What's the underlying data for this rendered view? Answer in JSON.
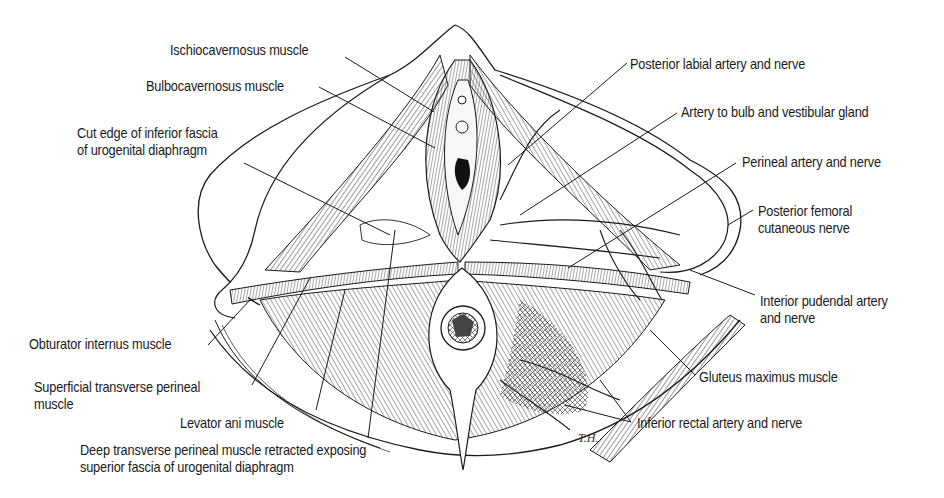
{
  "figure": {
    "signature": "T.H.",
    "colors": {
      "ink": "#1a1a1a",
      "background": "#ffffff",
      "shade": "#3a3a3a"
    }
  },
  "labels": {
    "left": [
      {
        "id": "ischiocavernosus",
        "text": "Ischiocavernosus muscle"
      },
      {
        "id": "bulbocavernosus",
        "text": "Bulbocavernosus muscle"
      },
      {
        "id": "cut_edge",
        "line1": "Cut edge of inferior fascia",
        "line2": "of urogenital diaphragm"
      },
      {
        "id": "obturator",
        "text": "Obturator internus muscle"
      },
      {
        "id": "superficial_transverse",
        "line1": "Superficial transverse perineal",
        "line2": "muscle"
      },
      {
        "id": "levator_ani",
        "text": "Levator ani muscle"
      },
      {
        "id": "deep_transverse",
        "line1": "Deep transverse perineal muscle retracted exposing",
        "line2": "superior fascia of urogenital diaphragm"
      }
    ],
    "right": [
      {
        "id": "posterior_labial",
        "text": "Posterior labial artery and nerve"
      },
      {
        "id": "artery_bulb",
        "text": "Artery to bulb and vestibular gland"
      },
      {
        "id": "perineal_artery",
        "text": "Perineal artery and nerve"
      },
      {
        "id": "posterior_femoral",
        "line1": "Posterior femoral",
        "line2": "cutaneous nerve"
      },
      {
        "id": "pudendal",
        "line1": "Interior pudendal artery",
        "line2": "and nerve"
      },
      {
        "id": "gluteus",
        "text": "Gluteus maximus muscle"
      },
      {
        "id": "inferior_rectal",
        "text": "Inferior rectal artery and nerve"
      }
    ]
  }
}
